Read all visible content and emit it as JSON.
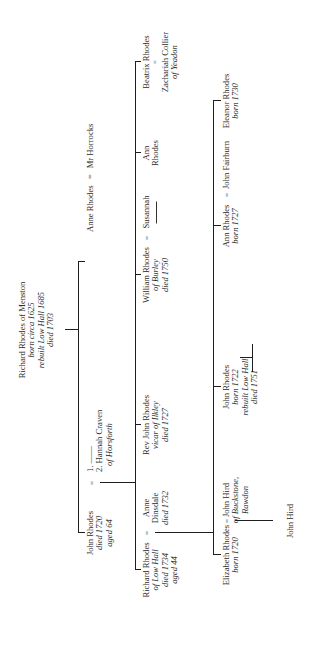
{
  "diagram": {
    "type": "family-tree",
    "orientation": "rotated-90-ccw",
    "line_color": "#1e1e1e",
    "text_color": "#2b2b2b"
  },
  "root": {
    "name": "Richard Rhodes of Menston",
    "details": [
      "born circa 1625",
      "rebuilt Low Hall 1685",
      "died 1703"
    ]
  },
  "generation1": {
    "anne": {
      "name": "Anne Rhodes",
      "equals": "=",
      "spouse": "Mr Horrocks"
    },
    "john": {
      "name": "John Rhodes",
      "details": [
        "died 1720",
        "aged 64"
      ],
      "equals": "=",
      "spouse1": "1. ——",
      "spouse2": "2. Hannah Craven",
      "spouse2_detail": "of Horsforth"
    }
  },
  "generation2": {
    "richard": {
      "name": "Richard Rhodes",
      "details": [
        "of Low Hall",
        "died 1734",
        "aged 44"
      ],
      "equals": "=",
      "spouse": "Anne",
      "spouse_line2": "Dinsdale",
      "spouse_detail": "died 1732"
    },
    "rev_john": {
      "name": "Rev John Rhodes",
      "details": [
        "vicar of Ilkley",
        "died 1727"
      ]
    },
    "william": {
      "name": "William Rhodes",
      "details": [
        "of Burley",
        "died 1750"
      ],
      "equals": "=",
      "spouse": "Susannah"
    },
    "ann": {
      "name": "Ann",
      "name_line2": "Rhodes"
    },
    "beatrix": {
      "name": "Beatrix Rhodes",
      "equals": "=",
      "spouse": "Zachariah Collier",
      "spouse_detail": "of Yeadon"
    }
  },
  "generation3": {
    "elizabeth": {
      "name": "Elizabeth Rhodes",
      "details": [
        "born 1720"
      ],
      "equals": "=",
      "spouse": "John Hird",
      "spouse_detail1": "of Buckstone,",
      "spouse_detail2": "Rawdon"
    },
    "john": {
      "name": "John Rhodes",
      "details": [
        "born 1722",
        "rebuilt Low Hall",
        "died 1751"
      ]
    },
    "ann": {
      "name": "Ann Rhodes",
      "details": [
        "born 1727"
      ],
      "equals": "=",
      "spouse": "John Fairburn"
    },
    "eleanor": {
      "name": "Eleanor Rhodes",
      "details": [
        "born 1730"
      ]
    }
  },
  "generation4": {
    "john_hird": {
      "name": "John Hird"
    }
  }
}
